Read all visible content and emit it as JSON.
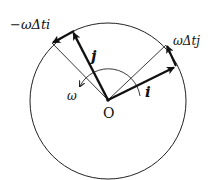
{
  "diagram": {
    "type": "rotating-basis-vectors",
    "origin": {
      "label": "O",
      "x": 108,
      "y": 100
    },
    "circle": {
      "cx": 108,
      "cy": 101,
      "r": 78
    },
    "vectors": {
      "i": {
        "label": "i",
        "tip": [
          175,
          67
        ]
      },
      "j": {
        "label": "j",
        "tip": [
          73,
          32
        ]
      },
      "delta_i": {
        "label": "ωΔtj",
        "from": [
          175,
          67
        ],
        "to": [
          166,
          45
        ]
      },
      "delta_j": {
        "label": "−ωΔti",
        "from": [
          73,
          32
        ],
        "to": [
          52,
          43
        ]
      }
    },
    "rotation": {
      "label": "ω"
    },
    "colors": {
      "stroke": "#111111",
      "background": "#ffffff"
    }
  },
  "labels": {
    "minus_omega_dt_i": "−ωΔti",
    "omega_dt_j": "ωΔtj",
    "i": "i",
    "j": "j",
    "omega": "ω",
    "origin": "O"
  }
}
